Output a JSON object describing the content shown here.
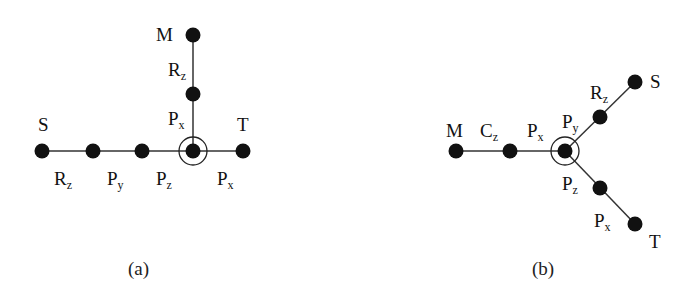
{
  "figure": {
    "panels": [
      {
        "id": "a",
        "caption": "(a)",
        "nodes": {
          "S": {
            "label": "S"
          },
          "M": {
            "label": "M"
          },
          "T": {
            "label": "T"
          }
        },
        "edge_labels": [
          {
            "base": "R",
            "sub": "z"
          },
          {
            "base": "P",
            "sub": "y"
          },
          {
            "base": "P",
            "sub": "z"
          },
          {
            "base": "P",
            "sub": "x"
          },
          {
            "base": "R",
            "sub": "z"
          },
          {
            "base": "P",
            "sub": "x"
          }
        ]
      },
      {
        "id": "b",
        "caption": "(b)",
        "nodes": {
          "M": {
            "label": "M"
          },
          "S": {
            "label": "S"
          },
          "T": {
            "label": "T"
          }
        },
        "edge_labels": [
          {
            "base": "C",
            "sub": "z"
          },
          {
            "base": "P",
            "sub": "x"
          },
          {
            "base": "P",
            "sub": "y"
          },
          {
            "base": "R",
            "sub": "z"
          },
          {
            "base": "P",
            "sub": "z"
          },
          {
            "base": "P",
            "sub": "x"
          }
        ]
      }
    ],
    "colors": {
      "node": "#111111",
      "edge": "#333333",
      "background": "#ffffff"
    }
  }
}
